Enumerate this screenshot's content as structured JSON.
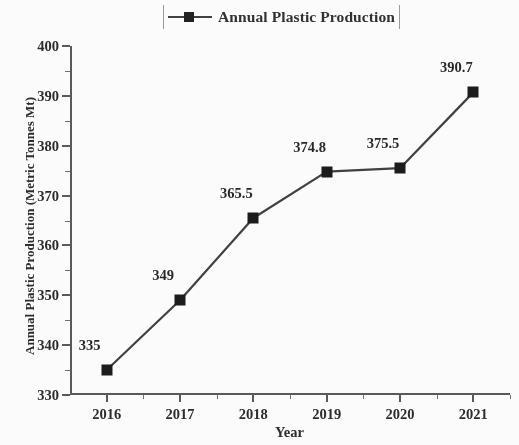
{
  "chart_data": {
    "type": "line",
    "title": "",
    "xlabel": "Year",
    "ylabel": "Annual Plastic Production (Metric Tonnes Mt)",
    "categories": [
      "2016",
      "2017",
      "2018",
      "2019",
      "2020",
      "2021"
    ],
    "values": [
      335,
      349,
      365.5,
      374.8,
      375.5,
      390.7
    ],
    "point_labels": [
      "335",
      "349",
      "365.5",
      "374.8",
      "375.5",
      "390.7"
    ],
    "series": [
      {
        "name": "Annual Plastic Production",
        "values": [
          335,
          349,
          365.5,
          374.8,
          375.5,
          390.7
        ]
      }
    ],
    "ylim": [
      330,
      400
    ],
    "ytick_labels": [
      "330",
      "340",
      "350",
      "360",
      "370",
      "380",
      "390",
      "400"
    ],
    "ytick_values": [
      330,
      340,
      350,
      360,
      370,
      380,
      390,
      400
    ],
    "y_minor_step": 5,
    "xlim": [
      2015.5,
      2021.5
    ],
    "grid": false,
    "legend": {
      "position": "top-center",
      "entries": [
        "Annual Plastic Production"
      ]
    },
    "marker": "square",
    "line_color": "#3b3b3b",
    "marker_color": "#141414",
    "background_color": "#ffffff"
  }
}
